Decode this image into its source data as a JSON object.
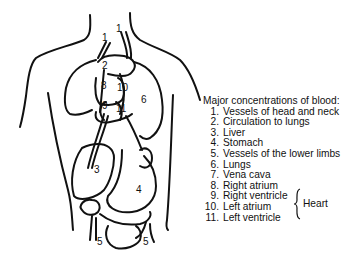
{
  "figure": {
    "body_labels": [
      {
        "text": "1",
        "x": 116,
        "y": 29
      },
      {
        "text": "1",
        "x": 102,
        "y": 38
      },
      {
        "text": "2",
        "x": 102,
        "y": 66
      },
      {
        "text": "8",
        "x": 101,
        "y": 85
      },
      {
        "text": "10",
        "x": 118,
        "y": 87
      },
      {
        "text": "6",
        "x": 141,
        "y": 98
      },
      {
        "text": "9",
        "x": 102,
        "y": 105
      },
      {
        "text": "11",
        "x": 117,
        "y": 108
      },
      {
        "text": "3",
        "x": 94,
        "y": 168
      },
      {
        "text": "4",
        "x": 137,
        "y": 188
      },
      {
        "text": "5",
        "x": 97,
        "y": 239
      },
      {
        "text": "5",
        "x": 143,
        "y": 239
      }
    ]
  },
  "legend": {
    "title": "Major concentrations of blood:",
    "items": [
      {
        "num": "1.",
        "label": "Vessels of head and neck"
      },
      {
        "num": "2.",
        "label": "Circulation to lungs"
      },
      {
        "num": "3.",
        "label": "Liver"
      },
      {
        "num": "4.",
        "label": "Stomach"
      },
      {
        "num": "5.",
        "label": "Vessels of the lower limbs"
      },
      {
        "num": "6.",
        "label": "Lungs"
      },
      {
        "num": "7.",
        "label": "Vena cava"
      },
      {
        "num": "8.",
        "label": "Right atrium"
      },
      {
        "num": "9.",
        "label": "Right ventricle"
      },
      {
        "num": "10.",
        "label": "Left atrium"
      },
      {
        "num": "11.",
        "label": "Left ventricle"
      }
    ],
    "group_label": "Heart"
  }
}
